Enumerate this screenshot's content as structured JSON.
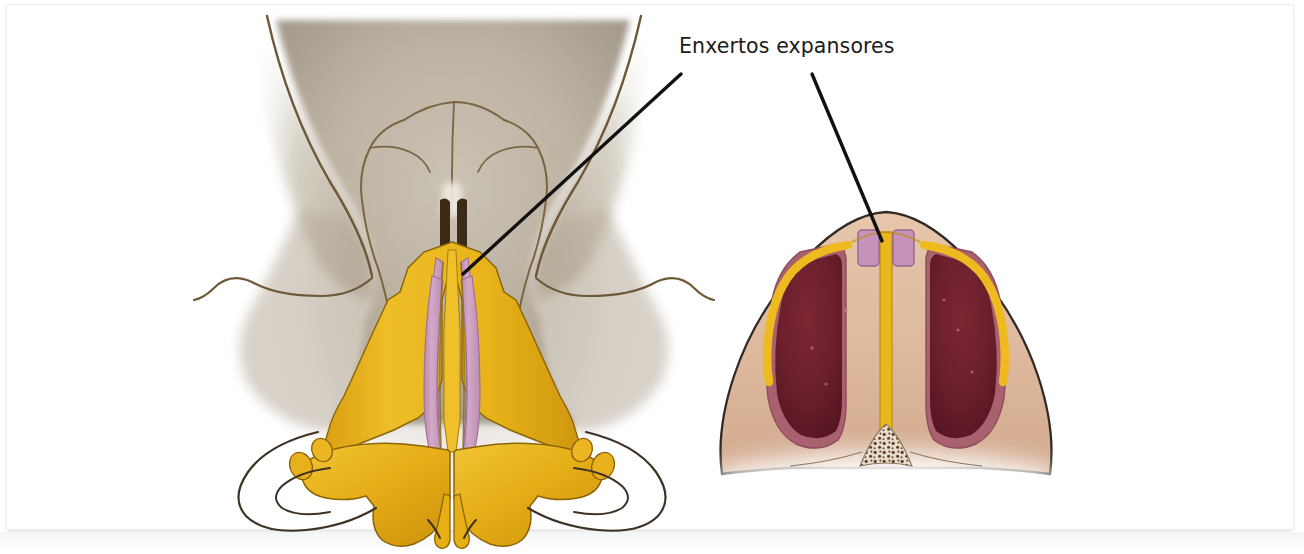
{
  "figure": {
    "kind": "medical-illustration",
    "background_color": "#ffffff",
    "frame_border_color": "#eceff0"
  },
  "annotation": {
    "label": "Enxertos expansores",
    "text_color": "#1b1b1b",
    "leader_line_color": "#111111",
    "leader_lines": [
      {
        "name": "leader-line-left",
        "x1": 681,
        "y1": 74,
        "x2": 463,
        "y2": 274,
        "points_to": "spreader-graft-left-frontal"
      },
      {
        "name": "leader-line-right",
        "x1": 812,
        "y1": 74,
        "x2": 882,
        "y2": 241,
        "points_to": "spreader-graft-right-cross-section"
      }
    ]
  },
  "views": [
    {
      "name": "frontal-nose-view",
      "position": "left",
      "description": "Vista frontal do nariz com ossos nasais, cartilagens laterais superiores e cartilagens alares",
      "structures": [
        {
          "name": "nasal-skin-envelope",
          "color": "#b6aa99"
        },
        {
          "name": "nasal-bones",
          "color": "#b2a795"
        },
        {
          "name": "upper-lateral-cartilage",
          "color": "#e8b21a"
        },
        {
          "name": "septal-cartilage",
          "color": "#e9b71c"
        },
        {
          "name": "spreader-graft-left",
          "color": "#c89bbe"
        },
        {
          "name": "spreader-graft-right",
          "color": "#c89bbe"
        },
        {
          "name": "dorsal-gap-shadow",
          "color": "#4a3522"
        },
        {
          "name": "lower-lateral-cartilage-left",
          "color": "#e7b01c"
        },
        {
          "name": "lower-lateral-cartilage-right",
          "color": "#e7b01c"
        },
        {
          "name": "sesamoid-cartilage-left",
          "color": "#e4ae1e"
        },
        {
          "name": "sesamoid-cartilage-right",
          "color": "#e4ae1e"
        },
        {
          "name": "nostril-outline-left",
          "color": "#4b3c28"
        },
        {
          "name": "nostril-outline-right",
          "color": "#4b3c28"
        },
        {
          "name": "outline-stroke",
          "color": "#5c4a30"
        }
      ]
    },
    {
      "name": "cross-section-view",
      "position": "right",
      "description": "Corte transversal do dorso nasal mostrando os enxertos expansores entre septo e cartilagens laterais superiores",
      "structures": [
        {
          "name": "skin-soft-tissue",
          "color": "#e0bca0"
        },
        {
          "name": "nasal-cavity-left",
          "color": "#6f1f2c"
        },
        {
          "name": "nasal-cavity-right",
          "color": "#6f1f2c"
        },
        {
          "name": "mucosa-lining",
          "color": "#a9616f"
        },
        {
          "name": "septum-cartilage",
          "color": "#eab81e"
        },
        {
          "name": "upper-lateral-cartilage-left",
          "color": "#eeb81d"
        },
        {
          "name": "upper-lateral-cartilage-right",
          "color": "#eeb81d"
        },
        {
          "name": "spreader-graft-left",
          "color": "#c694bb"
        },
        {
          "name": "spreader-graft-right",
          "color": "#c694bb"
        },
        {
          "name": "bony-stipple-base",
          "color": "#6a4a33"
        },
        {
          "name": "outline-stroke",
          "color": "#2f2a26"
        }
      ]
    }
  ]
}
